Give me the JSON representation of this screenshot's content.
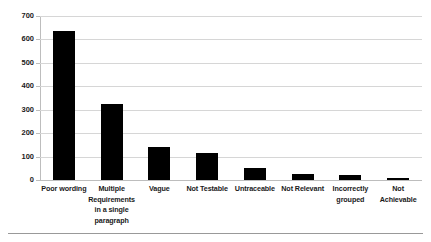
{
  "chart_data": {
    "type": "bar",
    "title": "",
    "subtitle": "",
    "xlabel": "",
    "ylabel": "",
    "categories": [
      "Poor wording",
      "Multiple Requirements in a single paragraph",
      "Vague",
      "Not Testable",
      "Untraceable",
      "Not Relevant",
      "Incorrectly grouped",
      "Not Achievable"
    ],
    "category_lines": [
      [
        "Poor wording"
      ],
      [
        "Multiple",
        "Requirements",
        "in a single",
        "paragraph"
      ],
      [
        "Vague"
      ],
      [
        "Not Testable"
      ],
      [
        "Untraceable"
      ],
      [
        "Not Relevant"
      ],
      [
        "Incorrectly",
        "grouped"
      ],
      [
        "Not",
        "Achievable"
      ]
    ],
    "values": [
      635,
      325,
      140,
      115,
      50,
      25,
      20,
      10
    ],
    "ylim": [
      0,
      700
    ],
    "ytick_values": [
      0,
      100,
      200,
      300,
      400,
      500,
      600,
      700
    ],
    "ytick_labels": [
      "0",
      "100",
      "200",
      "300",
      "400",
      "500",
      "600",
      "700"
    ],
    "grid": true,
    "grid_axis": "y",
    "legend": null,
    "bar_color": "#000000",
    "grid_color": "#d6d6d6",
    "axis_color": "#bdbdbd",
    "text_color": "#1a1a1a"
  }
}
